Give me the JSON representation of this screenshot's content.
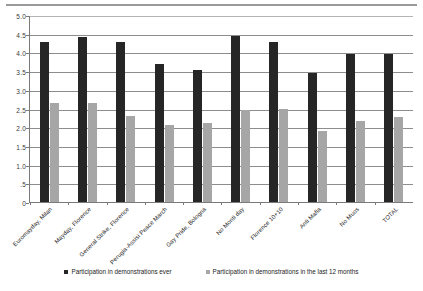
{
  "chart_data": {
    "type": "bar",
    "title": "",
    "xlabel": "",
    "ylabel": "",
    "ylim": [
      0,
      5.0
    ],
    "grid": true,
    "legend_position": "bottom",
    "y_ticks": [
      "0",
      ".5",
      "1.0",
      "1.5",
      "2.0",
      "2.5",
      "3.0",
      "3.5",
      "4.0",
      "4.5",
      "5.0"
    ],
    "y_tick_values": [
      0,
      0.5,
      1.0,
      1.5,
      2.0,
      2.5,
      3.0,
      3.5,
      4.0,
      4.5,
      5.0
    ],
    "categories": [
      "Euromayday, Milan",
      "Mayday, Florence",
      "General Strike, Florence",
      "Perugia-Assisi Peace March",
      "Gay Pride, Bologna",
      "No Monti day",
      "Florence 10+10",
      "Anti Mafia",
      "No Muos",
      "TOTAL"
    ],
    "series": [
      {
        "name": "Participation in demonstrations ever",
        "color": "#262626",
        "values": [
          4.27,
          4.41,
          4.27,
          3.69,
          3.54,
          4.43,
          4.29,
          3.44,
          3.95,
          3.97
        ]
      },
      {
        "name": "Participation in demonstrations in the last 12 months",
        "color": "#a6a6a6",
        "values": [
          2.65,
          2.64,
          2.29,
          2.07,
          2.11,
          2.45,
          2.5,
          1.9,
          2.16,
          2.27
        ]
      }
    ]
  },
  "legend": {
    "items": [
      {
        "label": "Participation in demonstrations ever"
      },
      {
        "label": "Participation in demonstrations in the last 12 months"
      }
    ]
  }
}
